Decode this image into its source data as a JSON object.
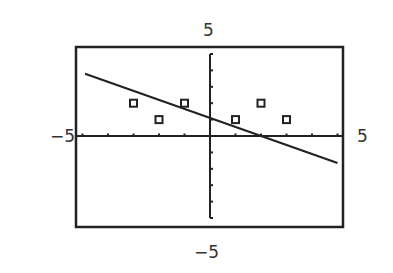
{
  "chart_data": {
    "type": "scatter",
    "title": "",
    "xlabel": "",
    "ylabel": "",
    "xlim": [
      -5,
      5
    ],
    "ylim": [
      -5,
      5
    ],
    "grid": false,
    "window_labels": {
      "ymax": "5",
      "ymin": "−5",
      "xmin": "−5",
      "xmax": "5"
    },
    "x_ticks": [
      -5,
      -4,
      -3,
      -2,
      -1,
      1,
      2,
      3,
      4,
      5
    ],
    "y_ticks": [
      -5,
      -4,
      -3,
      -2,
      -1,
      1,
      2,
      3,
      4,
      5
    ],
    "series": [
      {
        "name": "data points",
        "marker": "hollow-square",
        "points": [
          [
            -3,
            2
          ],
          [
            -2,
            1
          ],
          [
            -1,
            2
          ],
          [
            1,
            1
          ],
          [
            2,
            2
          ],
          [
            3,
            1
          ]
        ]
      },
      {
        "name": "line",
        "type": "line",
        "slope": -0.55,
        "intercept": 1.1,
        "points": [
          [
            -4.9,
            3.8
          ],
          [
            5.0,
            -1.65
          ]
        ]
      }
    ]
  }
}
